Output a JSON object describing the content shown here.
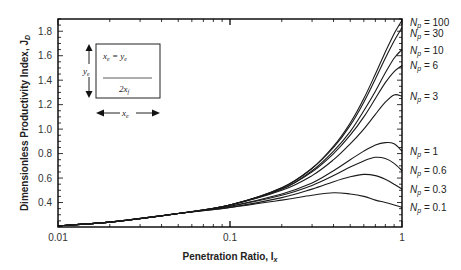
{
  "chart_data": {
    "type": "line",
    "title": "",
    "xlabel": "Penetration Ratio, I",
    "xlabel_sub": "x",
    "ylabel": "Dimensionless Productivity Index, J",
    "ylabel_sub": "D",
    "xscale": "log",
    "xlim": [
      0.01,
      1
    ],
    "ylim": [
      0.2,
      1.9
    ],
    "xticks": [
      0.01,
      0.1,
      1
    ],
    "xtick_labels": [
      "0.01",
      "0.1",
      "1"
    ],
    "yticks": [
      0.4,
      0.6,
      0.8,
      1.0,
      1.2,
      1.4,
      1.6,
      1.8
    ],
    "ytick_labels": [
      "0.4",
      "0.6",
      "0.8",
      "1.0",
      "1.2",
      "1.4",
      "1.6",
      "1.8"
    ],
    "grid": false,
    "legend_position": "right, labels at curve ends",
    "x": [
      0.01,
      0.02,
      0.05,
      0.1,
      0.2,
      0.3,
      0.4,
      0.5,
      0.6,
      0.7,
      0.8,
      0.9,
      1.0
    ],
    "series": [
      {
        "name": "Np = 100",
        "label_prefix": "N",
        "label_sub": "p",
        "label_value": "= 100",
        "label_y": 1.87,
        "values": [
          0.21,
          0.24,
          0.31,
          0.38,
          0.52,
          0.68,
          0.86,
          1.05,
          1.25,
          1.45,
          1.63,
          1.78,
          1.89
        ]
      },
      {
        "name": "Np = 30",
        "label_prefix": "N",
        "label_sub": "p",
        "label_value": "= 30",
        "label_y": 1.78,
        "values": [
          0.21,
          0.24,
          0.31,
          0.38,
          0.52,
          0.68,
          0.85,
          1.03,
          1.22,
          1.41,
          1.58,
          1.72,
          1.83
        ]
      },
      {
        "name": "Np = 10",
        "label_prefix": "N",
        "label_sub": "p",
        "label_value": "= 10",
        "label_y": 1.64,
        "values": [
          0.21,
          0.24,
          0.31,
          0.38,
          0.51,
          0.66,
          0.82,
          0.98,
          1.15,
          1.31,
          1.46,
          1.58,
          1.65
        ]
      },
      {
        "name": "Np = 6",
        "label_prefix": "N",
        "label_sub": "p",
        "label_value": "= 6",
        "label_y": 1.52,
        "values": [
          0.21,
          0.24,
          0.31,
          0.38,
          0.51,
          0.65,
          0.8,
          0.95,
          1.1,
          1.25,
          1.38,
          1.47,
          1.52
        ]
      },
      {
        "name": "Np = 3",
        "label_prefix": "N",
        "label_sub": "p",
        "label_value": "= 3",
        "label_y": 1.27,
        "values": [
          0.21,
          0.24,
          0.31,
          0.38,
          0.5,
          0.62,
          0.75,
          0.88,
          1.0,
          1.12,
          1.22,
          1.28,
          1.27
        ]
      },
      {
        "name": "Np = 1",
        "label_prefix": "N",
        "label_sub": "p",
        "label_value": "= 1",
        "label_y": 0.82,
        "values": [
          0.21,
          0.24,
          0.31,
          0.37,
          0.47,
          0.56,
          0.66,
          0.75,
          0.82,
          0.87,
          0.89,
          0.88,
          0.82
        ]
      },
      {
        "name": "Np = 0.6",
        "label_prefix": "N",
        "label_sub": "p",
        "label_value": "= 0.6",
        "label_y": 0.66,
        "values": [
          0.21,
          0.24,
          0.31,
          0.37,
          0.46,
          0.54,
          0.62,
          0.69,
          0.74,
          0.77,
          0.76,
          0.72,
          0.66
        ]
      },
      {
        "name": "Np = 0.3",
        "label_prefix": "N",
        "label_sub": "p",
        "label_value": "= 0.3",
        "label_y": 0.51,
        "values": [
          0.21,
          0.24,
          0.31,
          0.36,
          0.44,
          0.51,
          0.57,
          0.61,
          0.63,
          0.62,
          0.59,
          0.55,
          0.51
        ]
      },
      {
        "name": "Np = 0.1",
        "label_prefix": "N",
        "label_sub": "p",
        "label_value": "= 0.1",
        "label_y": 0.36,
        "values": [
          0.21,
          0.24,
          0.31,
          0.36,
          0.42,
          0.46,
          0.48,
          0.47,
          0.45,
          0.42,
          0.4,
          0.38,
          0.36
        ]
      }
    ],
    "inset": {
      "top_text": "x",
      "top_text_sub": "e",
      "top_eq": " = y",
      "top_eq_sub": "e",
      "bottom_text": "2x",
      "bottom_text_sub": "f",
      "side_label": "y",
      "side_label_sub": "e",
      "bottom_label": "x",
      "bottom_label_sub": "e"
    }
  },
  "colors": {
    "line": "#1a1a1a",
    "axis": "#000000",
    "text": "#222222",
    "background": "#ffffff"
  },
  "layout": {
    "plot_left": 58,
    "plot_right": 402,
    "plot_top": 19,
    "plot_bottom": 227
  }
}
